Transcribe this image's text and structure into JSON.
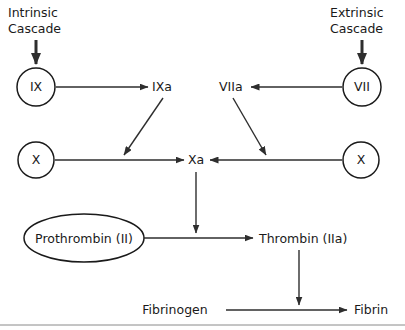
{
  "figure": {
    "width": 405,
    "height": 330,
    "background_color": "#ffffff",
    "stroke_color": "#2e2e2e",
    "text_color": "#1a1a1a",
    "rule_color": "#8a8a8a"
  },
  "headings": {
    "intrinsic_line1": "Intrinsic",
    "intrinsic_line2": "Cascade",
    "extrinsic_line1": "Extrinsic",
    "extrinsic_line2": "Cascade"
  },
  "nodes": {
    "factor_ix": "IX",
    "factor_ixa": "IXa",
    "factor_vii": "VII",
    "factor_viia": "VIIa",
    "factor_x_left": "X",
    "factor_x_right": "X",
    "factor_xa": "Xa",
    "prothrombin": "Prothrombin (II)",
    "thrombin": "Thrombin (IIa)",
    "fibrinogen": "Fibrinogen",
    "fibrin": "Fibrin"
  }
}
